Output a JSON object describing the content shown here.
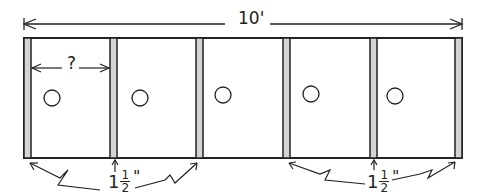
{
  "diagram": {
    "overall_dimension": "10'",
    "stud_spacing_label": "?",
    "stud_thickness": {
      "whole": "1",
      "numerator": "1",
      "denominator": "2",
      "unit": "\""
    },
    "studs_count": 6,
    "bays_count": 5,
    "outlets_count": 5,
    "colors": {
      "line": "#222222",
      "stud_fill": "#d4d4d4",
      "background": "#ffffff"
    }
  }
}
